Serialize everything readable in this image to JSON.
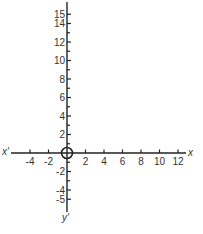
{
  "diagram": {
    "type": "cartesian-axes",
    "origin_px": [
      67,
      153
    ],
    "unit_px": 9.25,
    "x_axis": {
      "label_pos": "x",
      "label_neg": "x'",
      "range": [
        -5,
        12.5
      ],
      "ticks": [
        -4,
        -3,
        -2,
        -1,
        1,
        2,
        3,
        4,
        5,
        6,
        7,
        8,
        9,
        10,
        11,
        12
      ],
      "labeled_ticks": [
        {
          "value": -4,
          "text": "-4"
        },
        {
          "value": -2,
          "text": "-2"
        },
        {
          "value": 2,
          "text": "2"
        },
        {
          "value": 4,
          "text": "4"
        },
        {
          "value": 6,
          "text": "6"
        },
        {
          "value": 8,
          "text": "8"
        },
        {
          "value": 10,
          "text": "10"
        },
        {
          "value": 12,
          "text": "12"
        }
      ]
    },
    "y_axis": {
      "label_pos": "y",
      "label_neg": "y'",
      "range": [
        -6,
        16
      ],
      "labeled_ticks": [
        {
          "value": 15,
          "text": "15"
        },
        {
          "value": 14,
          "text": "14"
        },
        {
          "value": 12,
          "text": "12"
        },
        {
          "value": 10,
          "text": "10"
        },
        {
          "value": 8,
          "text": "8"
        },
        {
          "value": 6,
          "text": "6"
        },
        {
          "value": 4,
          "text": "4"
        },
        {
          "value": 2,
          "text": "2"
        },
        {
          "value": -2,
          "text": "-2"
        },
        {
          "value": -4,
          "text": "-4"
        },
        {
          "value": -5,
          "text": "-5"
        }
      ],
      "minor_ticks": [
        13,
        11,
        9,
        7,
        5,
        3,
        1,
        -1,
        -3
      ]
    },
    "origin_marker": "circle",
    "colors": {
      "stroke": "#222222",
      "text": "#333333"
    }
  }
}
